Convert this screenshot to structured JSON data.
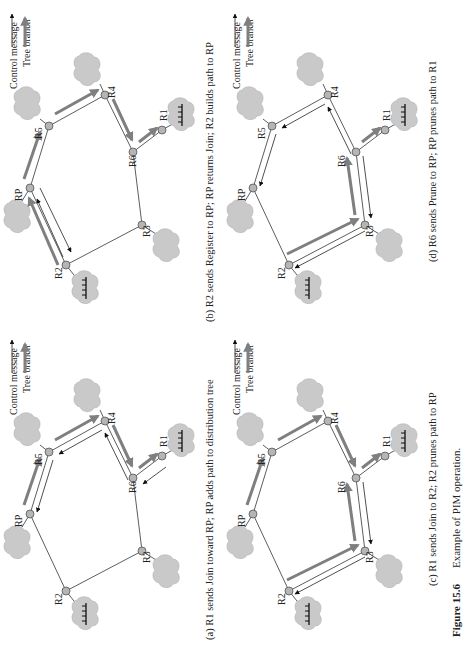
{
  "figure": {
    "number_label": "Figure 15.6",
    "title": "Example of PIM operation."
  },
  "legend": {
    "control_message": "Control message",
    "tree_branch": "Tree branch"
  },
  "colors": {
    "tree_branch": "#7f7f7f",
    "control_message": "#222222",
    "node_fill": "#b5b5b5",
    "cloud_fill": "#c9c9c9"
  },
  "nodes": [
    "RP",
    "R1",
    "R2",
    "R3",
    "R4",
    "R5",
    "R6"
  ],
  "panels": [
    {
      "id": "a",
      "caption": "(a) R1 sends Join toward RP; RP adds path to distribution tree",
      "tree_branches": [
        "RP→R5",
        "R5→R4",
        "R4→R6",
        "R6→R1"
      ],
      "control_messages": [
        "R1→R6",
        "R6→R4",
        "R4→R5",
        "R5→RP"
      ]
    },
    {
      "id": "b",
      "caption": "(b) R2 sends Register to RP; RP returns Join; R2 builds path to RP",
      "tree_branches": [
        "R2→RP",
        "RP→R5",
        "R5→R4",
        "R4→R6",
        "R6→R1"
      ],
      "control_messages": [
        "R2→RP",
        "RP→R2"
      ]
    },
    {
      "id": "c",
      "caption": "(c) R1 sends Join to R2;  R2 prunes path to RP",
      "tree_branches": [
        "RP→R5",
        "R5→R4",
        "R4→R6",
        "R6→R1",
        "R2→R3",
        "R3→R6"
      ],
      "control_messages": [
        "R6→R3",
        "R3→R2"
      ]
    },
    {
      "id": "d",
      "caption": "(d) R6 sends Prune to RP;  RP prunes path to R1",
      "tree_branches": [
        "R2→R3",
        "R3→R6",
        "R6→R1"
      ],
      "control_messages": [
        "R6→R3",
        "R3→R2",
        "R6→R4",
        "R4→R5",
        "R5→RP"
      ]
    }
  ]
}
